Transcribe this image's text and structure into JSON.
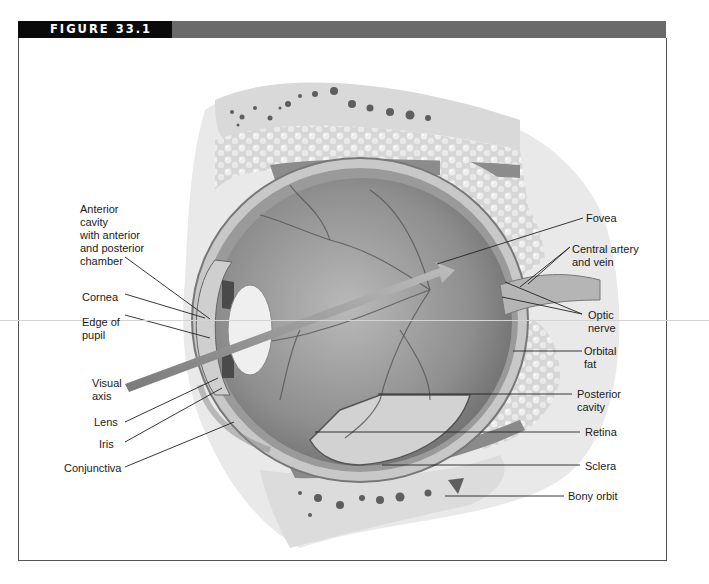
{
  "figure": {
    "label": "FIGURE 33.1",
    "header_color": "#6a6a6a",
    "label_bg": "#0a0a0a"
  },
  "labels": {
    "left": [
      {
        "id": "anterior_cavity",
        "text": "Anterior\ncavity\nwith anterior\nand posterior\nchamber"
      },
      {
        "id": "cornea",
        "text": "Cornea"
      },
      {
        "id": "edge_of_pupil",
        "text": "Edge of\npupil"
      },
      {
        "id": "visual_axis",
        "text": "Visual\naxis"
      },
      {
        "id": "lens",
        "text": "Lens"
      },
      {
        "id": "iris",
        "text": "Iris"
      },
      {
        "id": "conjunctiva",
        "text": "Conjunctiva"
      }
    ],
    "right": [
      {
        "id": "fovea",
        "text": "Fovea"
      },
      {
        "id": "central_artery_vein",
        "text": "Central artery\nand vein"
      },
      {
        "id": "optic_nerve",
        "text": "Optic\nnerve"
      },
      {
        "id": "orbital_fat",
        "text": "Orbital\nfat"
      },
      {
        "id": "posterior_cavity",
        "text": "Posterior\ncavity"
      },
      {
        "id": "retina",
        "text": "Retina"
      },
      {
        "id": "sclera",
        "text": "Sclera"
      },
      {
        "id": "bony_orbit",
        "text": "Bony orbit"
      }
    ]
  }
}
